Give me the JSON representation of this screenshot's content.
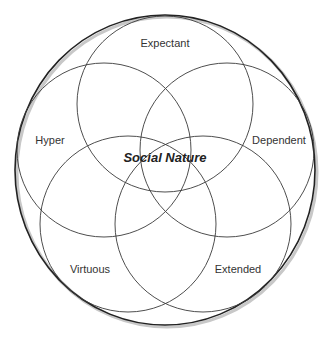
{
  "diagram": {
    "type": "overlapping-circles",
    "center_label": "Social Nature",
    "circles": [
      {
        "id": "expectant",
        "label": "Expectant"
      },
      {
        "id": "hyper",
        "label": "Hyper"
      },
      {
        "id": "dependent",
        "label": "Dependent"
      },
      {
        "id": "virtuous",
        "label": "Virtuous"
      },
      {
        "id": "extended",
        "label": "Extended"
      }
    ]
  }
}
